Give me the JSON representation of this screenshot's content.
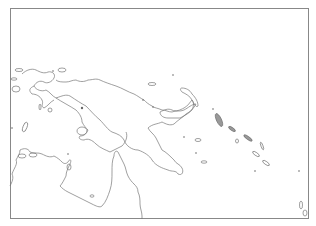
{
  "map": {
    "region": "New Guinea, Northern Australia and Solomon Islands",
    "frame": {
      "x": 10,
      "y": 8,
      "width": 299,
      "height": 211
    },
    "colors": {
      "coastline": "#777777",
      "frame": "#888888",
      "background": "#ffffff",
      "island_fill": "#999999"
    }
  }
}
